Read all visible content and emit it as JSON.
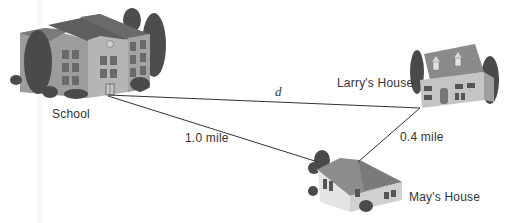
{
  "diagram": {
    "locations": [
      {
        "id": "school",
        "label": "School"
      },
      {
        "id": "larry",
        "label": "Larry's House"
      },
      {
        "id": "may",
        "label": "May's House"
      }
    ],
    "edges": [
      {
        "from": "school",
        "to": "larry",
        "label": "d"
      },
      {
        "from": "school",
        "to": "may",
        "label": "1.0 mile"
      },
      {
        "from": "may",
        "to": "larry",
        "label": "0.4 mile"
      }
    ]
  },
  "colors": {
    "line": "#333333",
    "roof": "#6e6e6e",
    "wall": "#b8b8b8",
    "tree": "#4a4a4a"
  }
}
